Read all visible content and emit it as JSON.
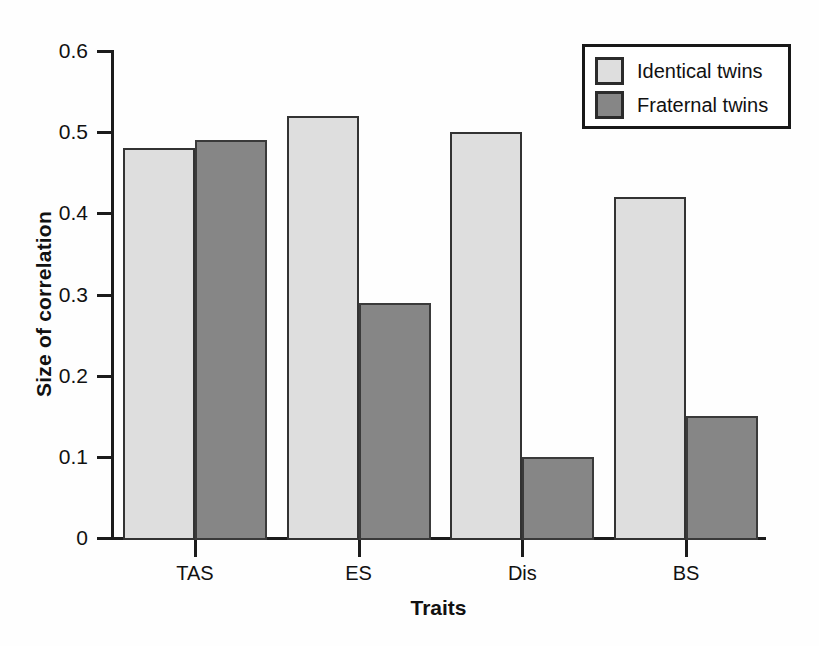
{
  "chart_data": {
    "type": "bar",
    "title": "",
    "xlabel": "Traits",
    "ylabel": "Size of correlation",
    "categories": [
      "TAS",
      "ES",
      "Dis",
      "BS"
    ],
    "series": [
      {
        "name": "Identical twins",
        "color": "#dedede",
        "values": [
          0.48,
          0.52,
          0.5,
          0.42
        ]
      },
      {
        "name": "Fraternal twins",
        "color": "#868686",
        "values": [
          0.49,
          0.29,
          0.1,
          0.15
        ]
      }
    ],
    "ylim": [
      0,
      0.6
    ],
    "ytick_labels": [
      "0.6",
      "0.5",
      "0.4",
      "0.3",
      "0.2",
      "0.1",
      "0"
    ],
    "ytick_values": [
      0.6,
      0.5,
      0.4,
      0.3,
      0.2,
      0.1,
      0
    ],
    "grid": false,
    "legend_position": "top-right"
  },
  "legend": {
    "items": [
      {
        "label": "Identical twins",
        "swatch": "identical"
      },
      {
        "label": "Fraternal twins",
        "swatch": "fraternal"
      }
    ]
  }
}
